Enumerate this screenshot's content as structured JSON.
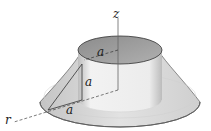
{
  "diagram": {
    "axes": {
      "z_label": "z",
      "r_label": "r"
    },
    "labels": {
      "top_radius": "a",
      "cylinder_height": "a",
      "base_offset": "a"
    },
    "colors": {
      "top_face": "#9a9a9a",
      "cone_surface": "#d6d6d6",
      "cylinder_wall": "#e9e9e9",
      "base_rim": "#efefef",
      "line": "#333333"
    }
  }
}
